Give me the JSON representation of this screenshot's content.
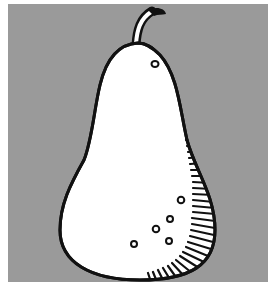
{
  "illustration": {
    "subject": "pear",
    "style": "black ink line drawing on gray panel",
    "colors": {
      "page_background": "#ffffff",
      "panel_background": "#9a9a9a",
      "pear_fill": "#ffffff",
      "ink": "#111111"
    },
    "features": {
      "stem": "curved stem at top",
      "speckles": 6,
      "shading": "hatched lines along right and bottom edge"
    }
  }
}
